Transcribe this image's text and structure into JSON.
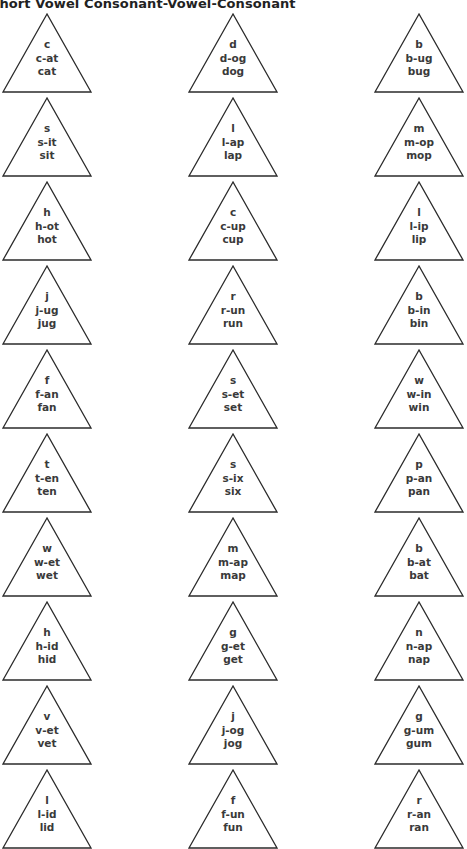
{
  "title": "Short Vowel Consonant-Vowel-Consonant",
  "columns_x": [
    2,
    188,
    374
  ],
  "rows_y": [
    13,
    97,
    181,
    265,
    349,
    433,
    517,
    601,
    685,
    769
  ],
  "triangles": [
    [
      {
        "letter": "c",
        "split": "c-at",
        "word": "cat"
      },
      {
        "letter": "d",
        "split": "d-og",
        "word": "dog"
      },
      {
        "letter": "b",
        "split": "b-ug",
        "word": "bug"
      }
    ],
    [
      {
        "letter": "s",
        "split": "s-it",
        "word": "sit"
      },
      {
        "letter": "l",
        "split": "l-ap",
        "word": "lap"
      },
      {
        "letter": "m",
        "split": "m-op",
        "word": "mop"
      }
    ],
    [
      {
        "letter": "h",
        "split": "h-ot",
        "word": "hot"
      },
      {
        "letter": "c",
        "split": "c-up",
        "word": "cup"
      },
      {
        "letter": "l",
        "split": "l-ip",
        "word": "lip"
      }
    ],
    [
      {
        "letter": "j",
        "split": "j-ug",
        "word": "jug"
      },
      {
        "letter": "r",
        "split": "r-un",
        "word": "run"
      },
      {
        "letter": "b",
        "split": "b-in",
        "word": "bin"
      }
    ],
    [
      {
        "letter": "f",
        "split": "f-an",
        "word": "fan"
      },
      {
        "letter": "s",
        "split": "s-et",
        "word": "set"
      },
      {
        "letter": "w",
        "split": "w-in",
        "word": "win"
      }
    ],
    [
      {
        "letter": "t",
        "split": "t-en",
        "word": "ten"
      },
      {
        "letter": "s",
        "split": "s-ix",
        "word": "six"
      },
      {
        "letter": "p",
        "split": "p-an",
        "word": "pan"
      }
    ],
    [
      {
        "letter": "w",
        "split": "w-et",
        "word": "wet"
      },
      {
        "letter": "m",
        "split": "m-ap",
        "word": "map"
      },
      {
        "letter": "b",
        "split": "b-at",
        "word": "bat"
      }
    ],
    [
      {
        "letter": "h",
        "split": "h-id",
        "word": "hid"
      },
      {
        "letter": "g",
        "split": "g-et",
        "word": "get"
      },
      {
        "letter": "n",
        "split": "n-ap",
        "word": "nap"
      }
    ],
    [
      {
        "letter": "v",
        "split": "v-et",
        "word": "vet"
      },
      {
        "letter": "j",
        "split": "j-og",
        "word": "jog"
      },
      {
        "letter": "g",
        "split": "g-um",
        "word": "gum"
      }
    ],
    [
      {
        "letter": "l",
        "split": "l-id",
        "word": "lid"
      },
      {
        "letter": "f",
        "split": "f-un",
        "word": "fun"
      },
      {
        "letter": "r",
        "split": "r-an",
        "word": "ran"
      }
    ]
  ],
  "colors": {
    "stroke": "#2b2b2b",
    "text": "#3a3a3a"
  }
}
